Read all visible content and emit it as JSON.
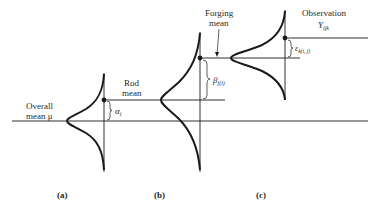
{
  "diagram": {
    "type": "nested-anova-normal-distributions",
    "colors": {
      "ink": "#1a1a1a",
      "background": "#ffffff"
    },
    "labels": {
      "overall_mean_line1": "Overall",
      "overall_mean_line2": "mean μ",
      "rod_mean_line1": "Rod",
      "rod_mean_line2": "mean",
      "forging_mean_line1": "Forging",
      "forging_mean_line2": "mean",
      "observation_line1": "Observation",
      "observation_symbol": "Y",
      "observation_subscript": "ijk"
    },
    "effects": {
      "alpha": {
        "symbol": "α",
        "subscript": "i"
      },
      "beta": {
        "symbol": "β",
        "subscript": "j(i)"
      },
      "epsilon": {
        "symbol": "ε",
        "subscript": "k(i, j)"
      }
    },
    "panels": [
      {
        "id": "a",
        "caption": "(a)"
      },
      {
        "id": "b",
        "caption": "(b)"
      },
      {
        "id": "c",
        "caption": "(c)"
      }
    ]
  }
}
